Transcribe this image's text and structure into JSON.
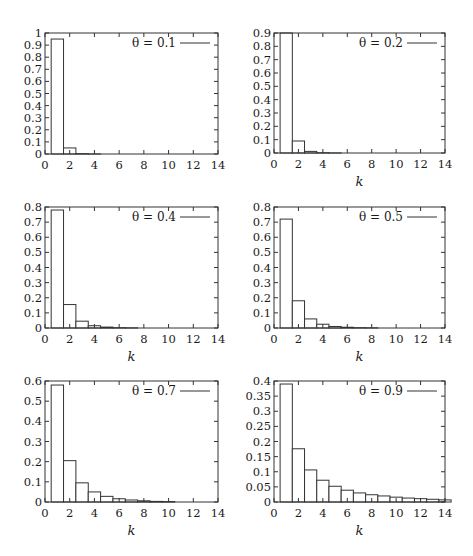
{
  "figure": {
    "xlabel": "k",
    "colors": {
      "stroke": "#333333",
      "bar_fill": "#ffffff",
      "background": "#ffffff"
    }
  },
  "chart_data": [
    {
      "type": "bar",
      "title": "",
      "legend": [
        "θ = 0.1"
      ],
      "legend_position": "top-right",
      "xlabel": "",
      "ylabel": "",
      "xlim": [
        0,
        14
      ],
      "ylim": [
        0,
        1
      ],
      "xticks": [
        "0",
        "2",
        "4",
        "6",
        "8",
        "10",
        "12",
        "14"
      ],
      "yticks": [
        "0",
        "0.1",
        "0.2",
        "0.3",
        "0.4",
        "0.5",
        "0.6",
        "0.7",
        "0.8",
        "0.9",
        "1"
      ],
      "grid": false,
      "categories": [
        1,
        2,
        3,
        4,
        5
      ],
      "values": [
        0.95,
        0.05,
        0.003,
        0.0002,
        0.0
      ]
    },
    {
      "type": "bar",
      "title": "",
      "legend": [
        "θ = 0.2"
      ],
      "legend_position": "top-right",
      "xlabel": "k",
      "ylabel": "",
      "xlim": [
        0,
        14
      ],
      "ylim": [
        0,
        0.9
      ],
      "xticks": [
        "0",
        "2",
        "4",
        "6",
        "8",
        "10",
        "12",
        "14"
      ],
      "yticks": [
        "0",
        "0.1",
        "0.2",
        "0.3",
        "0.4",
        "0.5",
        "0.6",
        "0.7",
        "0.8",
        "0.9"
      ],
      "grid": false,
      "categories": [
        1,
        2,
        3,
        4,
        5
      ],
      "values": [
        0.9,
        0.09,
        0.012,
        0.002,
        0.0003
      ]
    },
    {
      "type": "bar",
      "title": "",
      "legend": [
        "θ = 0.4"
      ],
      "legend_position": "top-right",
      "xlabel": "k",
      "ylabel": "",
      "xlim": [
        0,
        14
      ],
      "ylim": [
        0,
        0.8
      ],
      "xticks": [
        "0",
        "2",
        "4",
        "6",
        "8",
        "10",
        "12",
        "14"
      ],
      "yticks": [
        "0",
        "0.1",
        "0.2",
        "0.3",
        "0.4",
        "0.5",
        "0.6",
        "0.7",
        "0.8"
      ],
      "grid": false,
      "categories": [
        1,
        2,
        3,
        4,
        5,
        6,
        7
      ],
      "values": [
        0.78,
        0.155,
        0.045,
        0.015,
        0.006,
        0.002,
        0.001
      ]
    },
    {
      "type": "bar",
      "title": "",
      "legend": [
        "θ = 0.5"
      ],
      "legend_position": "top-right",
      "xlabel": "k",
      "ylabel": "",
      "xlim": [
        0,
        14
      ],
      "ylim": [
        0,
        0.8
      ],
      "xticks": [
        "0",
        "2",
        "4",
        "6",
        "8",
        "10",
        "12",
        "14"
      ],
      "yticks": [
        "0",
        "0.1",
        "0.2",
        "0.3",
        "0.4",
        "0.5",
        "0.6",
        "0.7",
        "0.8"
      ],
      "grid": false,
      "categories": [
        1,
        2,
        3,
        4,
        5,
        6,
        7,
        8
      ],
      "values": [
        0.72,
        0.18,
        0.06,
        0.025,
        0.01,
        0.005,
        0.002,
        0.001
      ]
    },
    {
      "type": "bar",
      "title": "",
      "legend": [
        "θ = 0.7"
      ],
      "legend_position": "top-right",
      "xlabel": "k",
      "ylabel": "",
      "xlim": [
        0,
        14
      ],
      "ylim": [
        0,
        0.6
      ],
      "xticks": [
        "0",
        "2",
        "4",
        "6",
        "8",
        "10",
        "12",
        "14"
      ],
      "yticks": [
        "0",
        "0.1",
        "0.2",
        "0.3",
        "0.4",
        "0.5",
        "0.6"
      ],
      "grid": false,
      "categories": [
        1,
        2,
        3,
        4,
        5,
        6,
        7,
        8,
        9,
        10
      ],
      "values": [
        0.58,
        0.205,
        0.095,
        0.05,
        0.028,
        0.016,
        0.01,
        0.006,
        0.003,
        0.002
      ]
    },
    {
      "type": "bar",
      "title": "",
      "legend": [
        "θ = 0.9"
      ],
      "legend_position": "top-right",
      "xlabel": "k",
      "ylabel": "",
      "xlim": [
        0,
        14
      ],
      "ylim": [
        0,
        0.4
      ],
      "xticks": [
        "0",
        "2",
        "4",
        "6",
        "8",
        "10",
        "12",
        "14"
      ],
      "yticks": [
        "0",
        "0.05",
        "0.1",
        "0.15",
        "0.2",
        "0.25",
        "0.3",
        "0.35",
        "0.4"
      ],
      "grid": false,
      "categories": [
        1,
        2,
        3,
        4,
        5,
        6,
        7,
        8,
        9,
        10,
        11,
        12,
        13,
        14
      ],
      "values": [
        0.39,
        0.176,
        0.106,
        0.072,
        0.052,
        0.039,
        0.03,
        0.024,
        0.02,
        0.016,
        0.013,
        0.011,
        0.009,
        0.007
      ]
    }
  ],
  "layout": {
    "panels": [
      {
        "plot": [
          45,
          33,
          218,
          154
        ],
        "xlabel_visible": false
      },
      {
        "plot": [
          274,
          33,
          445,
          153
        ],
        "xlabel_visible": true
      },
      {
        "plot": [
          45,
          207,
          218,
          328
        ],
        "xlabel_visible": true
      },
      {
        "plot": [
          274,
          207,
          445,
          328
        ],
        "xlabel_visible": true
      },
      {
        "plot": [
          45,
          381,
          218,
          502
        ],
        "xlabel_visible": true
      },
      {
        "plot": [
          274,
          381,
          445,
          502
        ],
        "xlabel_visible": true
      }
    ]
  }
}
